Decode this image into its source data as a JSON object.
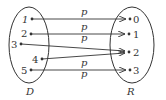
{
  "diagram": {
    "type": "mapping-diagram",
    "domain_set": {
      "label": "D",
      "elements": [
        "1",
        "2",
        "3",
        "4",
        "5"
      ]
    },
    "range_set": {
      "label": "R",
      "elements": [
        "0",
        "1",
        "2",
        "3"
      ]
    },
    "relation_label": "p",
    "arrow_labels": [
      "p",
      "p",
      "p",
      "p",
      "p"
    ],
    "mappings": [
      {
        "from": "1",
        "to": "0"
      },
      {
        "from": "2",
        "to": "1"
      },
      {
        "from": "3",
        "to": "2"
      },
      {
        "from": "4",
        "to": "2"
      },
      {
        "from": "5",
        "to": "3"
      }
    ],
    "colors": {
      "stroke": "#333333",
      "background": "#ffffff"
    }
  }
}
